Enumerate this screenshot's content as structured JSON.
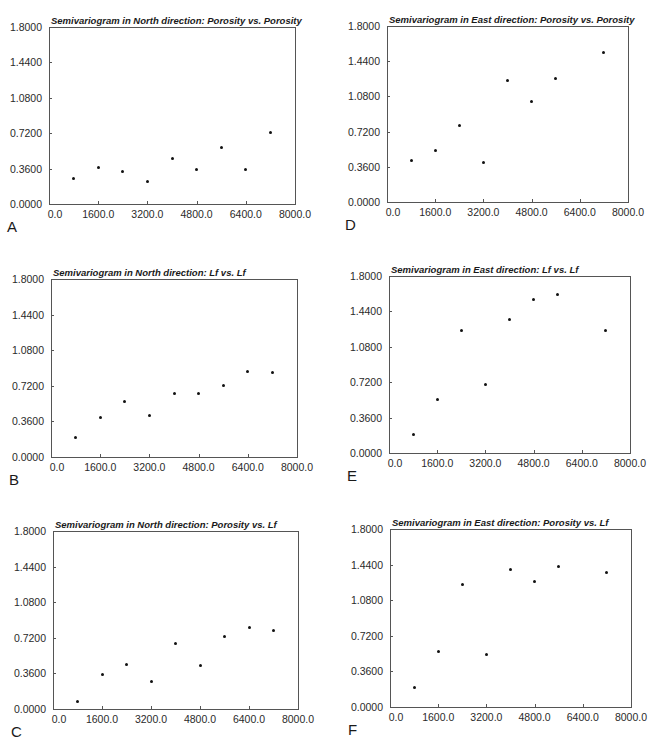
{
  "chart_data": [
    {
      "id": "A",
      "type": "scatter",
      "panel_label": "A",
      "title": "Semivariogram in North direction: Porosity vs. Porosity",
      "xlabel": "",
      "ylabel": "",
      "xlim": [
        0,
        8000
      ],
      "ylim": [
        0,
        1.8
      ],
      "x_ticks": [
        "0.0",
        "1600.0",
        "3200.0",
        "4800.0",
        "6400.0",
        "8000.0"
      ],
      "y_ticks": [
        "0.0000",
        "0.3600",
        "0.7200",
        "1.0800",
        "1.4400",
        "1.8000"
      ],
      "grid": false,
      "frame": {
        "left": 49,
        "top": 27,
        "right": 295,
        "bottom": 204
      },
      "points": [
        {
          "x": 800,
          "y": 0.26
        },
        {
          "x": 1600,
          "y": 0.37
        },
        {
          "x": 2400,
          "y": 0.33
        },
        {
          "x": 3200,
          "y": 0.23
        },
        {
          "x": 4000,
          "y": 0.46
        },
        {
          "x": 4800,
          "y": 0.35
        },
        {
          "x": 5600,
          "y": 0.57
        },
        {
          "x": 6400,
          "y": 0.35
        },
        {
          "x": 7200,
          "y": 0.73
        }
      ]
    },
    {
      "id": "B",
      "type": "scatter",
      "panel_label": "B",
      "title": "Semivariogram in North direction: Lf vs. Lf",
      "xlabel": "",
      "ylabel": "",
      "xlim": [
        0,
        8000
      ],
      "ylim": [
        0,
        1.8
      ],
      "x_ticks": [
        "0.0",
        "1600.0",
        "3200.0",
        "4800.0",
        "6400.0",
        "8000.0"
      ],
      "y_ticks": [
        "0.0000",
        "0.3600",
        "0.7200",
        "1.0800",
        "1.4400",
        "1.8000"
      ],
      "grid": false,
      "frame": {
        "left": 51,
        "top": 279,
        "right": 297,
        "bottom": 457
      },
      "points": [
        {
          "x": 800,
          "y": 0.2
        },
        {
          "x": 1600,
          "y": 0.4
        },
        {
          "x": 2400,
          "y": 0.56
        },
        {
          "x": 3200,
          "y": 0.42
        },
        {
          "x": 4000,
          "y": 0.64
        },
        {
          "x": 4800,
          "y": 0.64
        },
        {
          "x": 5600,
          "y": 0.72
        },
        {
          "x": 6400,
          "y": 0.86
        },
        {
          "x": 7200,
          "y": 0.85
        }
      ]
    },
    {
      "id": "C",
      "type": "scatter",
      "panel_label": "C",
      "title": "Semivariogram in North direction: Porosity vs. Lf",
      "xlabel": "",
      "ylabel": "",
      "xlim": [
        0,
        8000
      ],
      "ylim": [
        0,
        1.8
      ],
      "x_ticks": [
        "0.0",
        "1600.0",
        "3200.0",
        "4800.0",
        "6400.0",
        "8000.0"
      ],
      "y_ticks": [
        "0.0000",
        "0.3600",
        "0.7200",
        "1.0800",
        "1.4400",
        "1.8000"
      ],
      "grid": false,
      "frame": {
        "left": 53,
        "top": 531,
        "right": 298,
        "bottom": 709
      },
      "points": [
        {
          "x": 800,
          "y": 0.08
        },
        {
          "x": 1600,
          "y": 0.35
        },
        {
          "x": 2400,
          "y": 0.45
        },
        {
          "x": 3200,
          "y": 0.28
        },
        {
          "x": 4000,
          "y": 0.66
        },
        {
          "x": 4800,
          "y": 0.44
        },
        {
          "x": 5600,
          "y": 0.73
        },
        {
          "x": 6400,
          "y": 0.82
        },
        {
          "x": 7200,
          "y": 0.79
        }
      ]
    },
    {
      "id": "D",
      "type": "scatter",
      "panel_label": "D",
      "title": "Semivariogram in East direction: Porosity vs. Porosity",
      "xlabel": "",
      "ylabel": "",
      "xlim": [
        0,
        8000
      ],
      "ylim": [
        0,
        1.8
      ],
      "x_ticks": [
        "0.0",
        "1600.0",
        "3200.0",
        "4800.0",
        "6400.0",
        "8000.0"
      ],
      "y_ticks": [
        "0.0000",
        "0.3600",
        "0.7200",
        "1.0800",
        "1.4400",
        "1.8000"
      ],
      "grid": false,
      "frame": {
        "left": 387,
        "top": 26,
        "right": 628,
        "bottom": 202
      },
      "points": [
        {
          "x": 800,
          "y": 0.42
        },
        {
          "x": 1600,
          "y": 0.53
        },
        {
          "x": 2400,
          "y": 0.78
        },
        {
          "x": 3200,
          "y": 0.4
        },
        {
          "x": 4000,
          "y": 1.24
        },
        {
          "x": 4800,
          "y": 1.03
        },
        {
          "x": 5600,
          "y": 1.26
        },
        {
          "x": 7200,
          "y": 1.53
        }
      ]
    },
    {
      "id": "E",
      "type": "scatter",
      "panel_label": "E",
      "title": "Semivariogram in East direction: Lf vs. Lf",
      "xlabel": "",
      "ylabel": "",
      "xlim": [
        0,
        8000
      ],
      "ylim": [
        0,
        1.8
      ],
      "x_ticks": [
        "0.0",
        "1600.0",
        "3200.0",
        "4800.0",
        "6400.0",
        "8000.0"
      ],
      "y_ticks": [
        "0.0000",
        "0.3600",
        "0.7200",
        "1.0800",
        "1.4400",
        "1.8000"
      ],
      "grid": false,
      "frame": {
        "left": 389,
        "top": 276,
        "right": 630,
        "bottom": 453
      },
      "points": [
        {
          "x": 800,
          "y": 0.19
        },
        {
          "x": 1600,
          "y": 0.54
        },
        {
          "x": 2400,
          "y": 1.25
        },
        {
          "x": 3200,
          "y": 0.7
        },
        {
          "x": 4000,
          "y": 1.36
        },
        {
          "x": 4800,
          "y": 1.56
        },
        {
          "x": 5600,
          "y": 1.61
        },
        {
          "x": 7200,
          "y": 1.25
        }
      ]
    },
    {
      "id": "F",
      "type": "scatter",
      "panel_label": "F",
      "title": "Semivariogram in East direction: Porosity vs. Lf",
      "xlabel": "",
      "ylabel": "",
      "xlim": [
        0,
        8000
      ],
      "ylim": [
        0,
        1.8
      ],
      "x_ticks": [
        "0.0",
        "1600.0",
        "3200.0",
        "4800.0",
        "6400.0",
        "8000.0"
      ],
      "y_ticks": [
        "0.0000",
        "0.3600",
        "0.7200",
        "1.0800",
        "1.4400",
        "1.8000"
      ],
      "grid": false,
      "frame": {
        "left": 390,
        "top": 529,
        "right": 631,
        "bottom": 707
      },
      "points": [
        {
          "x": 800,
          "y": 0.2
        },
        {
          "x": 1600,
          "y": 0.56
        },
        {
          "x": 2400,
          "y": 1.24
        },
        {
          "x": 3200,
          "y": 0.53
        },
        {
          "x": 4000,
          "y": 1.39
        },
        {
          "x": 4800,
          "y": 1.27
        },
        {
          "x": 5600,
          "y": 1.42
        },
        {
          "x": 7200,
          "y": 1.36
        }
      ]
    }
  ]
}
